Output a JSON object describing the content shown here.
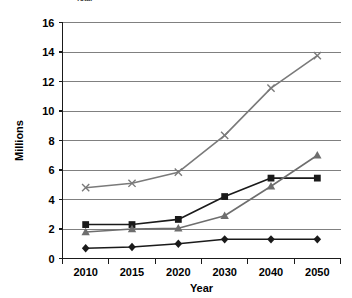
{
  "chart_data": {
    "type": "line",
    "title": "",
    "xlabel": "Year",
    "ylabel": "Millions",
    "categories": [
      "2010",
      "2015",
      "2020",
      "2030",
      "2040",
      "2050"
    ],
    "ylim": [
      0,
      16
    ],
    "ytick_values": [
      0,
      2,
      4,
      6,
      8,
      10,
      12,
      14,
      16
    ],
    "ytick_labels": [
      "0",
      "2",
      "4",
      "6",
      "8",
      "10",
      "12",
      "14",
      "16"
    ],
    "grid": "horizontal",
    "legend_position": "top",
    "legend_note": "legend cropped at top edge of image",
    "series": [
      {
        "name": "series-x",
        "marker": "x",
        "color": "#7a7a7a",
        "values": [
          4.8,
          5.1,
          5.85,
          8.35,
          11.55,
          13.75
        ]
      },
      {
        "name": "series-square",
        "marker": "square",
        "color": "#1a1a1a",
        "values": [
          2.3,
          2.3,
          2.65,
          4.2,
          5.45,
          5.45
        ]
      },
      {
        "name": "series-triangle",
        "marker": "triangle",
        "color": "#6e6e6e",
        "values": [
          1.8,
          2.0,
          2.05,
          2.9,
          4.9,
          7.0
        ]
      },
      {
        "name": "series-diamond",
        "marker": "diamond",
        "color": "#1a1a1a",
        "values": [
          0.7,
          0.78,
          1.0,
          1.3,
          1.3,
          1.3
        ]
      }
    ]
  },
  "legend": {
    "visible_entry_label": "Total"
  },
  "colors": {
    "gridline": "#808080",
    "axis": "#1a1a1a",
    "background": "#ffffff"
  }
}
